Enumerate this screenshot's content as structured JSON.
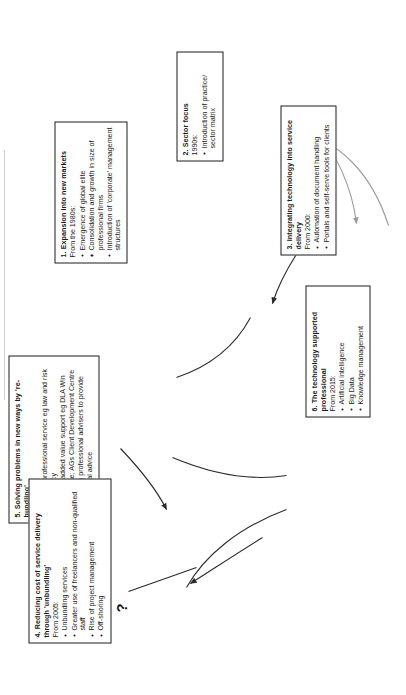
{
  "diagram": {
    "question_marker": "?",
    "orientation": "rotated-90-counterclockwise",
    "boxes": [
      {
        "id": "box1",
        "number": "1.",
        "title": "1. Expansion into new markets",
        "date": "From the 1980s:",
        "items": [
          "Emergence of global elite",
          "Consolidation and growth in size of professional firms",
          "Introduction of 'corporate' management structures"
        ]
      },
      {
        "id": "box2",
        "number": "2.",
        "title": "2. Sector focus",
        "date": "1990s:",
        "items": [
          "Introduction of practice/ sector matrix"
        ]
      },
      {
        "id": "box3",
        "number": "3.",
        "title": "3. Integrating technology into service delivery",
        "date": "From 2000:",
        "items": [
          "Automation of document handling",
          "Portals and self-serve tools for clients"
        ]
      },
      {
        "id": "box4",
        "number": "4.",
        "title": "4. Reducing cost of service delivery through 'unbundling'",
        "date": "From 2005:",
        "items": [
          "Unbundling services",
          "Greater use of freelancers and non-qualified staff",
          "Rise of project management",
          "Off-shoring"
        ]
      },
      {
        "id": "box5",
        "number": "5.",
        "title": "5. Solving problems in new ways by 're-bundling'",
        "date": "From 2013:",
        "items": [
          "Blending professional service eg law and risk consultancy",
          "Providing added value support eg DLA Win programme; AGs Client Development Centre",
          "Re-skilling professional advisers to provide commercial advice"
        ]
      },
      {
        "id": "box6",
        "number": "6.",
        "title": "6. The technology supported professional",
        "date": "From 2015:",
        "items": [
          "Artificial intelligence",
          "Big Data",
          "Knowledge management"
        ]
      }
    ],
    "colors": {
      "box_border": "#1c1c1c",
      "connector_dark": "#2a2a2a",
      "connector_light": "#9a9a9a",
      "background": "#ffffff",
      "text": "#1a1a1a"
    }
  }
}
